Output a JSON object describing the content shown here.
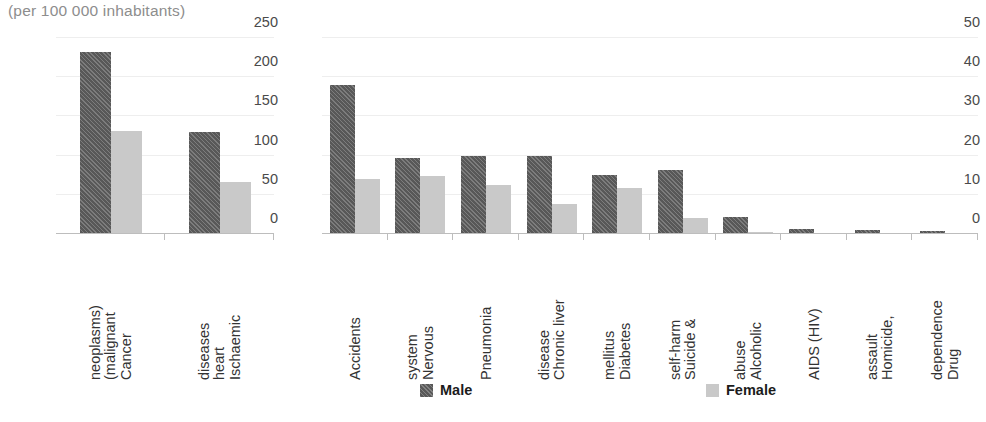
{
  "chart_data": {
    "type": "bar",
    "title": "(per 100 000 inhabitants)",
    "xlabel": "",
    "ylabel": "",
    "grid": true,
    "legend_position": "bottom",
    "series_names": [
      "Male",
      "Female"
    ],
    "colors": {
      "male": "#585858",
      "female": "#c9c9c9",
      "gridline": "#eeeeee",
      "axis": "#bdbdbd",
      "title": "#8d8d8d"
    },
    "panels": [
      {
        "name": "high-rate-causes",
        "ylim": [
          0,
          250
        ],
        "yticks": [
          0,
          50,
          100,
          150,
          200,
          250
        ],
        "categories": [
          "Cancer (malignant neoplasms)",
          "Ischaemic heart diseases"
        ],
        "category_lines": [
          [
            "Cancer",
            "(malignant",
            "neoplasms)"
          ],
          [
            "Ischaemic",
            "heart",
            "diseases"
          ]
        ],
        "series": [
          {
            "name": "Male",
            "values": [
              232,
              130
            ]
          },
          {
            "name": "Female",
            "values": [
              132,
              66
            ]
          }
        ]
      },
      {
        "name": "lower-rate-causes",
        "ylim": [
          0,
          50
        ],
        "yticks": [
          0,
          10,
          20,
          30,
          40,
          50
        ],
        "categories": [
          "Accidents",
          "Nervous system",
          "Pneumonia",
          "Chronic liver disease",
          "Diabetes mellitus",
          "Suicide & self-harm",
          "Alcoholic abuse",
          "AIDS (HIV)",
          "Homicide, assault",
          "Drug dependence"
        ],
        "category_lines": [
          [
            "Accidents"
          ],
          [
            "Nervous",
            "system"
          ],
          [
            "Pneumonia"
          ],
          [
            "Chronic liver",
            "disease"
          ],
          [
            "Diabetes",
            "mellitus"
          ],
          [
            "Suicide &",
            "self-harm"
          ],
          [
            "Alcoholic",
            "abuse"
          ],
          [
            "AIDS (HIV)"
          ],
          [
            "Homicide,",
            "assault"
          ],
          [
            "Drug",
            "dependence"
          ]
        ],
        "series": [
          {
            "name": "Male",
            "values": [
              38,
              19.3,
              19.9,
              20,
              15,
              16.3,
              4.3,
              1.3,
              1.0,
              0.7
            ]
          },
          {
            "name": "Female",
            "values": [
              14,
              14.9,
              12.4,
              7.7,
              11.7,
              4.2,
              0.6,
              0.2,
              0.2,
              0.1
            ]
          }
        ]
      }
    ]
  },
  "legend": {
    "male_label": "Male",
    "female_label": "Female"
  }
}
